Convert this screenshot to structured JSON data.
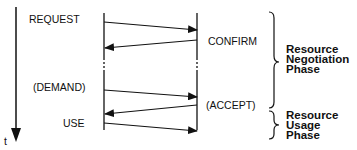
{
  "diagram": {
    "time_axis_label": "t",
    "left_messages": [
      "REQUEST",
      "(DEMAND)",
      "USE"
    ],
    "right_messages": [
      "CONFIRM",
      "(ACCEPT)"
    ],
    "phases": [
      {
        "lines": [
          "Resource",
          "Negotiation",
          "Phase"
        ]
      },
      {
        "lines": [
          "Resource",
          "Usage",
          "Phase"
        ]
      }
    ],
    "arrows": [
      {
        "label": "REQUEST",
        "from": "left",
        "to": "right"
      },
      {
        "label": "CONFIRM",
        "from": "right",
        "to": "left"
      },
      {
        "label": "(DEMAND)",
        "from": "left",
        "to": "right"
      },
      {
        "label": "(ACCEPT)",
        "from": "right",
        "to": "left"
      },
      {
        "label": "USE",
        "from": "left",
        "to": "right"
      }
    ],
    "line_color": "#111111"
  }
}
